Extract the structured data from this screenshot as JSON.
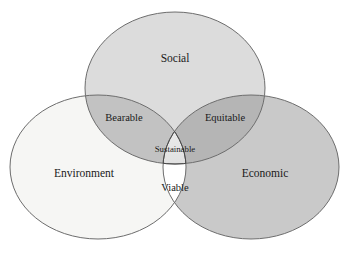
{
  "diagram": {
    "type": "venn-3-set",
    "background_color": "#ffffff",
    "outline_color": "#6d6d6d",
    "text_color": "#1a1a1a",
    "sets": [
      {
        "id": "social",
        "label": "Social",
        "fill": "#dcdcdc",
        "cx": 175,
        "cy": 88,
        "rx": 90,
        "ry": 76,
        "label_x": 175,
        "label_y": 59
      },
      {
        "id": "environment",
        "label": "Environment",
        "fill": "#f6f6f4",
        "cx": 98,
        "cy": 167,
        "rx": 88,
        "ry": 72,
        "label_x": 84,
        "label_y": 174
      },
      {
        "id": "economic",
        "label": "Economic",
        "fill": "#c9c9c9",
        "cx": 251,
        "cy": 167,
        "rx": 88,
        "ry": 72,
        "label_x": 265,
        "label_y": 174
      }
    ],
    "intersections": [
      {
        "id": "bearable",
        "label": "Bearable",
        "sets": [
          "social",
          "environment"
        ],
        "fill": "#c2c2c2",
        "label_x": 124,
        "label_y": 119
      },
      {
        "id": "equitable",
        "label": "Equitable",
        "sets": [
          "social",
          "economic"
        ],
        "fill": "#b5b5b5",
        "label_x": 225,
        "label_y": 119
      },
      {
        "id": "viable",
        "label": "Viable",
        "sets": [
          "environment",
          "economic"
        ],
        "fill": "#ffffff",
        "label_x": 175,
        "label_y": 189
      }
    ],
    "core": {
      "id": "sustainable",
      "label": "Sustainable",
      "sets": [
        "social",
        "environment",
        "economic"
      ],
      "fill_start": "#ffffff",
      "fill_end": "#b9b9b9",
      "label_x": 175,
      "label_y": 150
    }
  }
}
